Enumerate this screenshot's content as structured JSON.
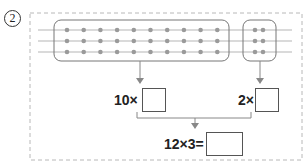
{
  "problem_number": "2",
  "diagram": {
    "rows": 3,
    "left_group_columns": 10,
    "right_group_columns": 2,
    "dot_color": "#9a9a9a",
    "line_color": "#b0b0b0"
  },
  "labels": {
    "left_multiplier": "10×",
    "right_multiplier": "2×",
    "equation": "12×3="
  },
  "answers": {
    "left": "",
    "right": "",
    "total": ""
  }
}
